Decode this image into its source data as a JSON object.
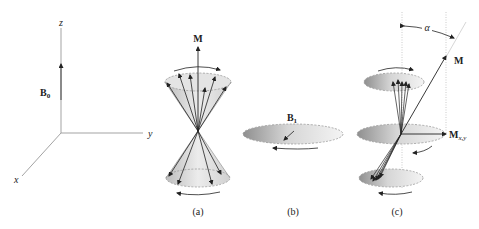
{
  "axes": {
    "z_label": "z",
    "y_label": "y",
    "x_label": "x",
    "field_label": "B",
    "field_subscript": "0"
  },
  "panel_a": {
    "vector_label": "M",
    "caption": "(a)"
  },
  "panel_b": {
    "field_label": "B",
    "field_subscript": "1",
    "caption": "(b)"
  },
  "panel_c": {
    "vector_label": "M",
    "angle_label": "α",
    "transverse_label": "M",
    "transverse_subscript": "x,y",
    "caption": "(c)"
  },
  "colors": {
    "line": "#333333",
    "axis": "#888888",
    "dash": "#999999",
    "shade_dark": "#9a9a9a",
    "shade_light": "#f2f2f2"
  }
}
